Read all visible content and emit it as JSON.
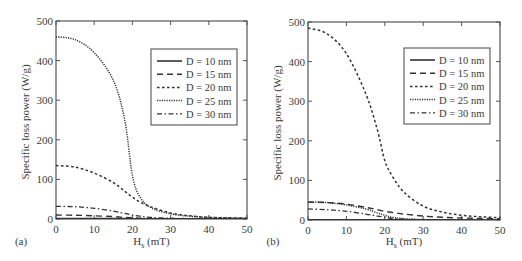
{
  "chart_data": [
    {
      "type": "line",
      "panel_label": "(a)",
      "title": "",
      "xlabel": "H",
      "xlabel_sub": "s",
      "xlabel_unit": " (mT)",
      "ylabel": "Specific loss power (W/g)",
      "xlim": [
        0,
        50
      ],
      "ylim": [
        0,
        500
      ],
      "xticks": [
        0,
        10,
        20,
        30,
        40,
        50
      ],
      "yticks": [
        0,
        100,
        200,
        300,
        400,
        500
      ],
      "grid": false,
      "legend_position": "upper right",
      "x": [
        0,
        5,
        10,
        15,
        18,
        20,
        22,
        25,
        30,
        35,
        40,
        45,
        50
      ],
      "series": [
        {
          "name": "D = 10 nm",
          "style": "solid",
          "values": [
            1,
            1,
            1,
            1,
            1,
            0.8,
            0.7,
            0.5,
            0.4,
            0.3,
            0.2,
            0.2,
            0.1
          ]
        },
        {
          "name": "D = 15 nm",
          "style": "dashed",
          "values": [
            10,
            9.5,
            8,
            6,
            4,
            3,
            2,
            1,
            0.5,
            0.3,
            0.2,
            0.1,
            0.1
          ]
        },
        {
          "name": "D = 20 nm",
          "style": "shortdash",
          "values": [
            135,
            131,
            116,
            92,
            70,
            55,
            43,
            30,
            15,
            8,
            4,
            3,
            2
          ]
        },
        {
          "name": "D = 25 nm",
          "style": "dotted",
          "values": [
            460,
            453,
            420,
            350,
            250,
            110,
            55,
            28,
            13,
            7,
            4,
            3,
            2
          ]
        },
        {
          "name": "D = 30 nm",
          "style": "dashdot",
          "values": [
            32,
            31,
            27,
            20,
            14,
            10,
            7,
            4,
            2,
            1,
            1,
            0.5,
            0.3
          ]
        }
      ]
    },
    {
      "type": "line",
      "panel_label": "(b)",
      "title": "",
      "xlabel": "H",
      "xlabel_sub": "s",
      "xlabel_unit": " (mT)",
      "ylabel": "Specific loss power (W/g)",
      "xlim": [
        0,
        50
      ],
      "ylim": [
        0,
        500
      ],
      "xticks": [
        0,
        10,
        20,
        30,
        40,
        50
      ],
      "yticks": [
        0,
        100,
        200,
        300,
        400,
        500
      ],
      "grid": false,
      "legend_position": "upper right",
      "x": [
        0,
        5,
        10,
        15,
        18,
        20,
        22,
        25,
        30,
        35,
        40,
        45,
        50
      ],
      "series": [
        {
          "name": "D = 10 nm",
          "style": "solid",
          "values": [
            0.5,
            0.5,
            0.5,
            0.5,
            0.4,
            0.4,
            0.3,
            0.3,
            0.2,
            0.2,
            0.1,
            0.1,
            0.1
          ]
        },
        {
          "name": "D = 15 nm",
          "style": "dashed",
          "values": [
            45,
            44,
            40,
            32,
            26,
            22,
            19,
            15,
            10,
            7,
            5,
            4,
            3
          ]
        },
        {
          "name": "D = 20 nm",
          "style": "shortdash",
          "values": [
            485,
            470,
            420,
            320,
            230,
            150,
            110,
            70,
            35,
            20,
            12,
            8,
            6
          ]
        },
        {
          "name": "D = 25 nm",
          "style": "dotted",
          "values": [
            46,
            44,
            38,
            28,
            18,
            12,
            7,
            3,
            1,
            0.5,
            0.3,
            0.2,
            0.1
          ]
        },
        {
          "name": "D = 30 nm",
          "style": "dashdot",
          "values": [
            28,
            26,
            22,
            15,
            10,
            7,
            4,
            2,
            0.5,
            0.3,
            0.2,
            0.1,
            0.1
          ]
        }
      ]
    }
  ],
  "panels": [
    {
      "label": "(a)"
    },
    {
      "label": "(b)"
    }
  ]
}
